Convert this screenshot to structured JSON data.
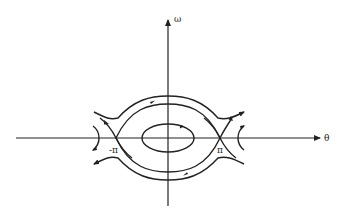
{
  "diagram": {
    "type": "phase-portrait",
    "axes": {
      "horizontal_label": "θ",
      "vertical_label": "ω"
    },
    "saddle_points": [
      {
        "label": "-π",
        "x": 116,
        "y": 138
      },
      {
        "label": "π",
        "x": 220,
        "y": 138
      }
    ],
    "center": {
      "x": 168,
      "y": 138
    },
    "colors": {
      "stroke": "#222222",
      "background": "#ffffff"
    }
  }
}
